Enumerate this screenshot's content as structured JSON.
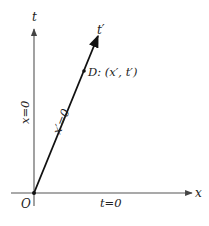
{
  "diagram": {
    "type": "spacetime-diagram",
    "colors": {
      "axis": "#444444",
      "worldline": "#111111",
      "text": "#222222",
      "background": "#ffffff"
    },
    "axes": {
      "t_label": "t",
      "x_label": "x",
      "origin_label": "O",
      "t_prime_label": "t′"
    },
    "lines": {
      "t_axis_caption": "x=0",
      "t_prime_axis_caption": "x′=0",
      "x_axis_caption": "t=0"
    },
    "point": {
      "name": "D",
      "label": "D: (x′, t′)"
    }
  }
}
